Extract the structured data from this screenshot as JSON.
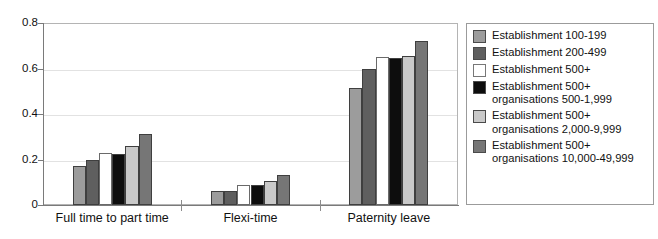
{
  "figure": {
    "top_caption_fragment": "· · · · ·  ·   ·· ·· ·  ·",
    "background_color": "#ffffff"
  },
  "chart_data": {
    "type": "bar",
    "title": "",
    "xlabel": "",
    "ylabel": "",
    "ylim": [
      0,
      0.8
    ],
    "yticks": [
      "0",
      "0.2",
      "0.4",
      "0.6",
      "0.8"
    ],
    "ytick_values": [
      0,
      0.2,
      0.4,
      0.6,
      0.8
    ],
    "grid": true,
    "grid_axis": "y",
    "legend_position": "right-outside",
    "categories": [
      "Full time to part time",
      "Flexi-time",
      "Paternity leave"
    ],
    "series": [
      {
        "name": "Establishment 100-199",
        "color": "#9c9c9c",
        "values": [
          0.17,
          0.06,
          0.515
        ]
      },
      {
        "name": "Establishment 200-499",
        "color": "#5f5f5f",
        "values": [
          0.2,
          0.06,
          0.6
        ]
      },
      {
        "name": "Establishment 500+",
        "color": "#ffffff",
        "values": [
          0.23,
          0.09,
          0.65
        ]
      },
      {
        "name": "Establishment 500+\norganisations 500-1,999",
        "color": "#0d0d0d",
        "values": [
          0.225,
          0.09,
          0.645
        ]
      },
      {
        "name": "Establishment 500+\norganisations 2,000-9,999",
        "color": "#c9c9c9",
        "values": [
          0.26,
          0.105,
          0.655
        ]
      },
      {
        "name": "Establishment 500+\norganisations 10,000-49,999",
        "color": "#767676",
        "values": [
          0.31,
          0.13,
          0.72
        ]
      }
    ]
  }
}
